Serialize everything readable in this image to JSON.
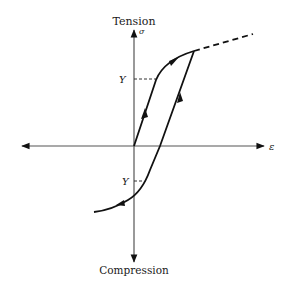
{
  "diagram": {
    "type": "stress-strain hysteresis (Bauschinger effect)",
    "labels": {
      "tension": "Tension",
      "compression": "Compression",
      "sigma": "σ",
      "epsilon": "ε",
      "yield_upper": "Y",
      "yield_lower": "Y"
    },
    "axes": {
      "vertical": "stress σ (Tension up, Compression down)",
      "horizontal": "strain ε"
    },
    "colors": {
      "axis": "#555555",
      "curve": "#111111",
      "text": "#1a1a1a"
    },
    "paths": {
      "loading": "Linear from origin up to yield Y, then curved hardening to peak",
      "extension": "Dashed continuation beyond peak",
      "unloading": "Linear downward from peak crossing strain axis",
      "reverse_loading": "Curves into compression with yield at -Y"
    }
  }
}
